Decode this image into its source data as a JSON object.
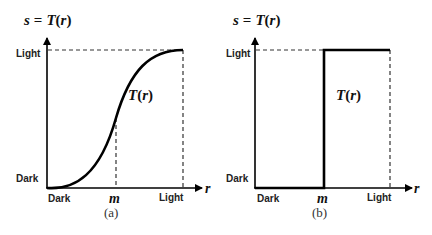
{
  "panels": [
    {
      "id": "a",
      "caption": "(a)",
      "ylabel_s": "s",
      "ylabel_eq": "=",
      "ylabel_T": "T",
      "ylabel_open": "(",
      "ylabel_r": "r",
      "ylabel_close": ")",
      "y_ticks": {
        "top": "Light",
        "bottom": "Dark"
      },
      "x_ticks": {
        "left": "Dark",
        "mid": "m",
        "right": "Light"
      },
      "x_axis_label": "r",
      "curve_label_T": "T",
      "curve_label_r": "r",
      "curve_type": "sigmoid contrast stretching"
    },
    {
      "id": "b",
      "caption": "(b)",
      "ylabel_s": "s",
      "ylabel_eq": "=",
      "ylabel_T": "T",
      "ylabel_open": "(",
      "ylabel_r": "r",
      "ylabel_close": ")",
      "y_ticks": {
        "top": "Light",
        "bottom": "Dark"
      },
      "x_ticks": {
        "left": "Dark",
        "mid": "m",
        "right": "Light"
      },
      "x_axis_label": "r",
      "curve_label_T": "T",
      "curve_label_r": "r",
      "curve_type": "thresholding step function"
    }
  ],
  "colors": {
    "line": "#000000",
    "text": "#222222",
    "dashed": "#333333"
  }
}
